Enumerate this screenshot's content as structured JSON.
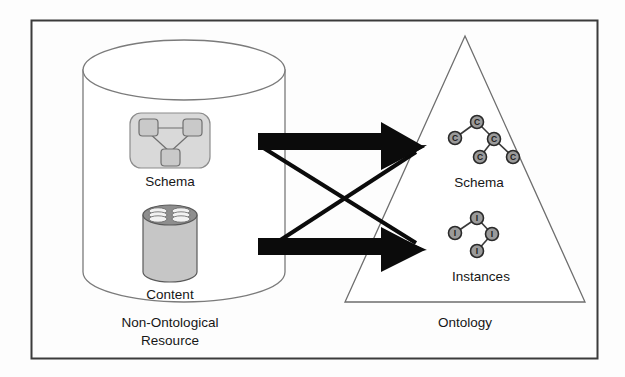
{
  "figure": {
    "name": "non-ontological-resource-to-ontology-diagram",
    "border_color": "#3b3b3b",
    "background": "#fdfdfd"
  },
  "left_panel": {
    "caption_line1": "Non-Ontological",
    "caption_line2": "Resource",
    "cylinder": {
      "name": "non-ontological-resource-cylinder",
      "fill": "#ffffff",
      "stroke": "#7b7b7b"
    },
    "schema_block": {
      "label": "Schema",
      "fill": "#d9d9d9",
      "stroke": "#8c8c8c",
      "node_fill": "#c9c9c9",
      "node_stroke": "#6f6f6f",
      "nodes": [
        {
          "id": "s1",
          "x": 148,
          "y": 128
        },
        {
          "id": "s2",
          "x": 192,
          "y": 128
        },
        {
          "id": "s3",
          "x": 170,
          "y": 157
        }
      ],
      "edges": [
        {
          "from": "s1",
          "to": "s2"
        },
        {
          "from": "s1",
          "to": "s3"
        },
        {
          "from": "s2",
          "to": "s3"
        }
      ]
    },
    "content_block": {
      "label": "Content",
      "fill": "#c6c6c6",
      "stroke": "#5a5a5a",
      "top_fill": "#8e8e8e"
    }
  },
  "right_panel": {
    "caption": "Ontology",
    "triangle": {
      "name": "ontology-triangle",
      "stroke": "#6e6e6e",
      "fill": "#ffffff"
    },
    "schema_tree": {
      "label": "Schema",
      "node_letter": "C",
      "node_fill": "#9a9a9a",
      "node_stroke": "#2a2a2a",
      "edge_stroke": "#3a3a3a",
      "nodes": [
        {
          "id": "c-root",
          "x": 477,
          "y": 122
        },
        {
          "id": "c-left",
          "x": 455,
          "y": 138
        },
        {
          "id": "c-mid",
          "x": 494,
          "y": 139
        },
        {
          "id": "c-ll",
          "x": 480,
          "y": 157
        },
        {
          "id": "c-rr",
          "x": 513,
          "y": 157
        }
      ],
      "edges": [
        {
          "from": "c-root",
          "to": "c-left"
        },
        {
          "from": "c-root",
          "to": "c-mid"
        },
        {
          "from": "c-mid",
          "to": "c-ll"
        },
        {
          "from": "c-mid",
          "to": "c-rr"
        }
      ]
    },
    "instances_tree": {
      "label": "Instances",
      "node_letter": "I",
      "node_fill": "#9a9a9a",
      "node_stroke": "#2a2a2a",
      "edge_stroke": "#3a3a3a",
      "nodes": [
        {
          "id": "i-root",
          "x": 477,
          "y": 218
        },
        {
          "id": "i-left",
          "x": 455,
          "y": 233
        },
        {
          "id": "i-right",
          "x": 492,
          "y": 234
        },
        {
          "id": "i-bottom",
          "x": 477,
          "y": 251
        }
      ],
      "edges": [
        {
          "from": "i-root",
          "to": "i-left"
        },
        {
          "from": "i-root",
          "to": "i-right"
        },
        {
          "from": "i-right",
          "to": "i-bottom"
        }
      ]
    }
  },
  "connectors": {
    "color": "#0b0b0b",
    "block_arrows": [
      {
        "name": "schema-to-schema-block-arrow",
        "from": "schema-block",
        "to": "ontology-schema",
        "y": 141
      },
      {
        "name": "content-to-instances-block-arrow",
        "from": "content-block",
        "to": "ontology-instances",
        "y": 246
      }
    ],
    "cross_arrows": [
      {
        "name": "schema-to-instances-cross-arrow",
        "from": "schema-block",
        "to": "ontology-instances"
      },
      {
        "name": "content-to-schema-cross-arrow",
        "from": "content-block",
        "to": "ontology-schema"
      }
    ]
  }
}
